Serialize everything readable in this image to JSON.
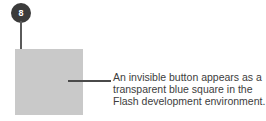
{
  "figure": {
    "background_color": "#ffffff",
    "callout": {
      "number": "8",
      "badge_color": "#3b3b3b",
      "badge_text_color": "#ffffff",
      "leader_line_color": "#5a5a5a"
    },
    "stage_square": {
      "name": "invisible-button-square",
      "fill_color": "#c9c9c9",
      "registration_mark_icon": "crosshair-icon"
    },
    "caption": {
      "leader_line_color": "#4a4a4a",
      "text_color": "#3d3d3d",
      "lines": [
        "An invisible button appears as a",
        "transparent blue square in the",
        "Flash development environment."
      ],
      "full_text": "An invisible button appears as a transparent blue square in the Flash development environment."
    }
  }
}
